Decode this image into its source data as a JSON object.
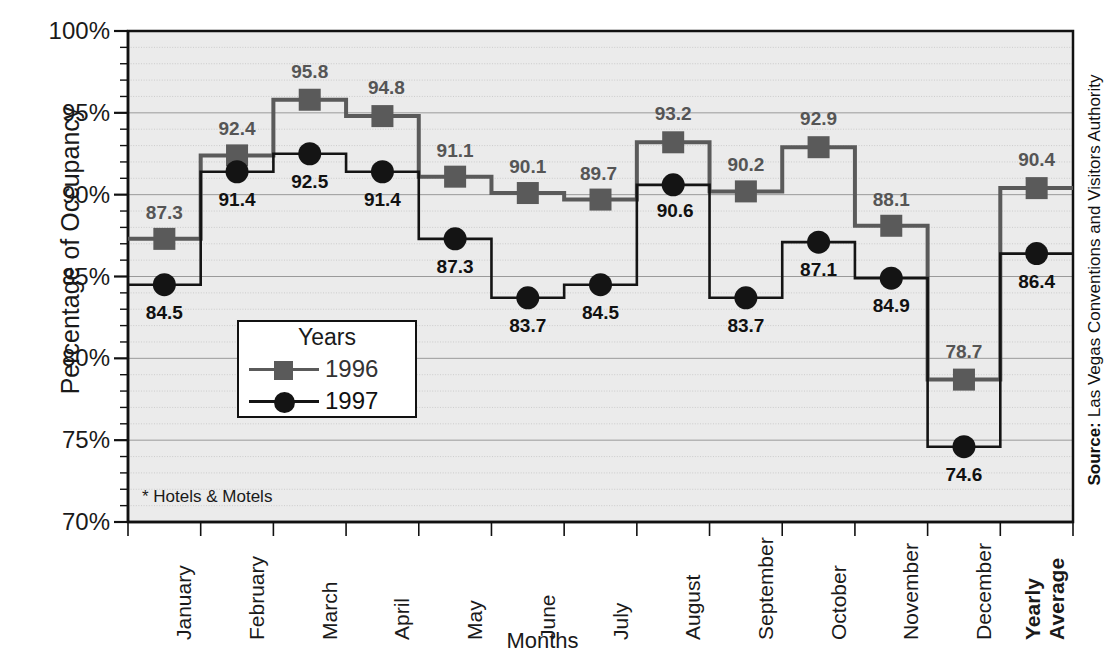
{
  "chart_data": {
    "type": "line",
    "subtype": "step",
    "title": "",
    "xlabel": "Months",
    "ylabel": "Percentage of Occupancy",
    "ylim": [
      70,
      100
    ],
    "ytick_labels": [
      "100%",
      "95%",
      "90%",
      "85%",
      "80%",
      "75%",
      "70%"
    ],
    "ytick_values": [
      100,
      95,
      90,
      85,
      80,
      75,
      70
    ],
    "y_minor_step": 1,
    "grid": "horizontal",
    "legend_position": "inside-lower-left",
    "categories": [
      "January",
      "February",
      "March",
      "April",
      "May",
      "June",
      "July",
      "August",
      "September",
      "October",
      "November",
      "December",
      "Yearly Average"
    ],
    "bold_categories": [
      "Yearly Average"
    ],
    "series": [
      {
        "name": "1996",
        "marker": "square",
        "color": "#5a5a5a",
        "values": [
          87.3,
          92.4,
          95.8,
          94.8,
          91.1,
          90.1,
          89.7,
          93.2,
          90.2,
          92.9,
          88.1,
          78.7,
          90.4
        ]
      },
      {
        "name": "1997",
        "marker": "circle",
        "color": "#141414",
        "values": [
          84.5,
          91.4,
          92.5,
          91.4,
          87.3,
          83.7,
          84.5,
          90.6,
          83.7,
          87.1,
          84.9,
          74.6,
          86.4
        ]
      }
    ],
    "annotations": {
      "footnote": "* Hotels & Motels",
      "source_prefix": "Source:",
      "source_text": "Las Vegas Conventions and Visitors Authority"
    }
  },
  "legend": {
    "title": "Years",
    "entries": [
      {
        "label": "1996"
      },
      {
        "label": "1997"
      }
    ]
  },
  "colors": {
    "series_1996": "#5a5a5a",
    "series_1997": "#141414",
    "plot_background": "#ebebeb",
    "axis": "#111111",
    "gridline": "#bdbdbd"
  }
}
